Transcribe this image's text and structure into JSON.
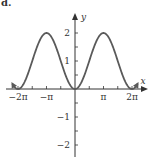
{
  "panel_label": "d.",
  "chart_data": {
    "type": "line",
    "title": "",
    "function": "y = 1 - cos(x)",
    "xlabel": "x",
    "ylabel": "y",
    "xlim": [
      -7.0,
      7.0
    ],
    "ylim": [
      -2.5,
      2.6
    ],
    "x_ticks": [
      {
        "value": -6.2832,
        "label": "−2π"
      },
      {
        "value": -3.1416,
        "label": "−π"
      },
      {
        "value": 3.1416,
        "label": "π"
      },
      {
        "value": 6.2832,
        "label": "2π"
      }
    ],
    "x_minor_tick_step": 1.5708,
    "y_ticks": [
      {
        "value": 2,
        "label": "2"
      },
      {
        "value": 1,
        "label": "1"
      },
      {
        "value": -1,
        "label": "−1"
      },
      {
        "value": -2,
        "label": "−2"
      }
    ],
    "y_minor_tick_step": 0.5,
    "key_points": [
      {
        "x": -6.2832,
        "y": 0
      },
      {
        "x": -3.1416,
        "y": 2
      },
      {
        "x": 0,
        "y": 0
      },
      {
        "x": 3.1416,
        "y": 2
      },
      {
        "x": 6.2832,
        "y": 0
      }
    ],
    "curve_color": "#5a5a5a",
    "axis_color": "#333333",
    "grid": false,
    "legend": null
  }
}
